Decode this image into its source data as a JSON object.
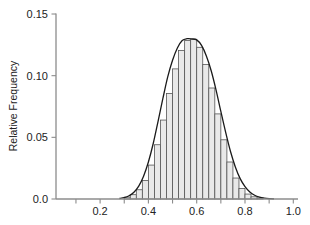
{
  "chart_data": {
    "type": "bar",
    "title": "",
    "subtitle": "",
    "xlabel": "",
    "ylabel": "Relative Frequency",
    "xlim": [
      0.0,
      1.0
    ],
    "ylim": [
      0.0,
      0.15
    ],
    "grid": false,
    "legend": null,
    "bin_width": 0.025,
    "x_ticks": [
      "0.2",
      "0.4",
      "0.6",
      "0.8",
      "1.0"
    ],
    "x_tick_values": [
      0.2,
      0.4,
      0.6,
      0.8,
      1.0
    ],
    "x_minor_tick_values": [
      0.1,
      0.3,
      0.5,
      0.7,
      0.9
    ],
    "y_ticks": [
      "0.00",
      "0.05",
      "0.10",
      "0.15"
    ],
    "y_tick_values": [
      0.0,
      0.05,
      0.1,
      0.15
    ],
    "y_tick_labels_displayed": [
      "0.0",
      "0.05",
      "0.10",
      "0.15"
    ],
    "bar_fill_color": "#e9e9e9",
    "bar_edge_color": "#555555",
    "curve_color": "#1a1a1a",
    "axis_color": "#8c8c8c",
    "bin_centers": [
      0.3125,
      0.3375,
      0.3625,
      0.3875,
      0.4125,
      0.4375,
      0.4625,
      0.4875,
      0.5125,
      0.5375,
      0.5625,
      0.5875,
      0.6125,
      0.6375,
      0.6625,
      0.6875,
      0.7125,
      0.7375,
      0.7625,
      0.7875,
      0.8125,
      0.8375,
      0.8625
    ],
    "values": [
      0.0015,
      0.0035,
      0.0075,
      0.015,
      0.0275,
      0.044,
      0.064,
      0.0855,
      0.1055,
      0.1205,
      0.1285,
      0.1295,
      0.123,
      0.109,
      0.09,
      0.069,
      0.048,
      0.03,
      0.017,
      0.0085,
      0.004,
      0.0018,
      0.0008
    ],
    "curve": {
      "type": "normal-density-overlay",
      "mean": 0.6,
      "peak_value": 0.129,
      "points_x": [
        0.28,
        0.3,
        0.32,
        0.34,
        0.36,
        0.38,
        0.4,
        0.42,
        0.44,
        0.46,
        0.48,
        0.5,
        0.52,
        0.54,
        0.56,
        0.58,
        0.6,
        0.62,
        0.64,
        0.66,
        0.68,
        0.7,
        0.72,
        0.74,
        0.76,
        0.78,
        0.8,
        0.82,
        0.84,
        0.86,
        0.88,
        0.9,
        0.92
      ],
      "points_y": [
        0.0004,
        0.0011,
        0.0026,
        0.0055,
        0.0105,
        0.0185,
        0.03,
        0.045,
        0.063,
        0.0815,
        0.099,
        0.1125,
        0.1225,
        0.1285,
        0.13,
        0.1298,
        0.129,
        0.1245,
        0.116,
        0.104,
        0.0885,
        0.071,
        0.054,
        0.0385,
        0.026,
        0.0165,
        0.01,
        0.0057,
        0.003,
        0.0015,
        0.0007,
        0.0003,
        0.0001
      ]
    }
  }
}
